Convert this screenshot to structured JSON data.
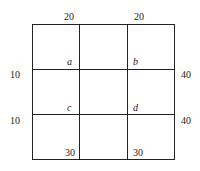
{
  "diagram": {
    "top_labels": [
      "20",
      "20"
    ],
    "left_labels": [
      "10",
      "10"
    ],
    "right_labels": [
      "40",
      "40"
    ],
    "bottom_labels": [
      "30",
      "30"
    ],
    "points": [
      "a",
      "b",
      "c",
      "d"
    ]
  }
}
